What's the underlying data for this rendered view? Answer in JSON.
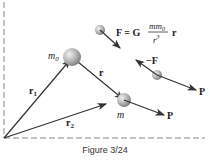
{
  "figure": {
    "caption": "Figure 3/24",
    "labels": {
      "m0": "m",
      "m0_sub": "0",
      "m": "m",
      "r": "r",
      "r1": "r",
      "r1_sub": "1",
      "r2": "r",
      "r2_sub": "2",
      "P_upper": "P",
      "P_lower": "P",
      "neg_F": "−F",
      "F_eq_lhs": "F = G",
      "F_num": "mm",
      "F_num_sub": "0",
      "F_den": "r",
      "F_den_sup": "3",
      "F_eq_rhs": "r"
    },
    "colors": {
      "line": "#333333",
      "dash": "#888888",
      "sphere_light": "#e6e6e6",
      "sphere_dark": "#8a8a8a"
    }
  }
}
